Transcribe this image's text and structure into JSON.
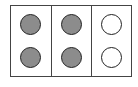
{
  "diagram": {
    "type": "counting-frame",
    "columns": 3,
    "rows": 2,
    "filled_color": "#8c8c8c",
    "empty_color": "#ffffff",
    "border_color": "#444444",
    "cells": [
      {
        "col": 0,
        "row": 0,
        "filled": true
      },
      {
        "col": 0,
        "row": 1,
        "filled": true
      },
      {
        "col": 1,
        "row": 0,
        "filled": true
      },
      {
        "col": 1,
        "row": 1,
        "filled": true
      },
      {
        "col": 2,
        "row": 0,
        "filled": false
      },
      {
        "col": 2,
        "row": 1,
        "filled": false
      }
    ],
    "filled_count": 4,
    "total_count": 6
  }
}
